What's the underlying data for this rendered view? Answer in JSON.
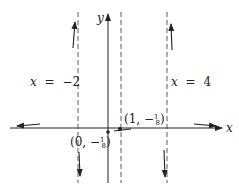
{
  "diagram": {
    "type": "graph-sketch",
    "axes": {
      "x_label": "x",
      "y_label": "y"
    },
    "asymptotes": [
      {
        "label_var": "x",
        "label_eq": "=",
        "label_val": "−2",
        "value": -2
      },
      {
        "label_var": "x",
        "label_eq": "=",
        "label_val": "4",
        "value": 4
      },
      {
        "value": 1,
        "label": ""
      }
    ],
    "points": [
      {
        "label_prefix": "(1, −",
        "frac_num": "1",
        "frac_den": "8",
        "label_suffix": ")",
        "x": 1,
        "y": "-1/8"
      },
      {
        "label_prefix": "(0, −",
        "frac_num": "1",
        "frac_den": "8",
        "label_suffix": ")",
        "x": 0,
        "y": "-1/8"
      }
    ],
    "colors": {
      "ink": "#222222",
      "background": "#ffffff"
    }
  }
}
